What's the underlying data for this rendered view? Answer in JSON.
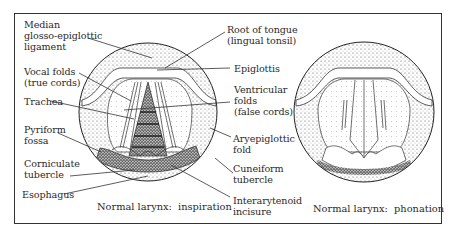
{
  "figure": {
    "panels": [
      {
        "id": "inspiration",
        "caption": "Normal larynx:  inspiration",
        "labels": {
          "median_glosso": [
            "Median",
            "glosso-epiglottic",
            "ligament"
          ],
          "vocal_folds": [
            "Vocal folds",
            "(true cords)"
          ],
          "trachea": "Trachea",
          "pyriform": [
            "Pyriform",
            "fossa"
          ],
          "corniculate": [
            "Corniculate",
            "tubercle"
          ],
          "esophagus": "Esophagus",
          "root_tongue": [
            "Root of tongue",
            "(lingual tonsil)"
          ],
          "epiglottis": "Epiglottis",
          "ventricular": [
            "Ventricular",
            "folds",
            "(false cords)"
          ],
          "aryepiglottic": [
            "Aryepiglottic",
            "fold"
          ],
          "cuneiform": [
            "Cuneiform",
            "tubercle"
          ],
          "interarytenoid": [
            "Interarytenoid",
            "incisure"
          ]
        }
      },
      {
        "id": "phonation",
        "caption": "Normal larynx:  phonation"
      }
    ]
  }
}
